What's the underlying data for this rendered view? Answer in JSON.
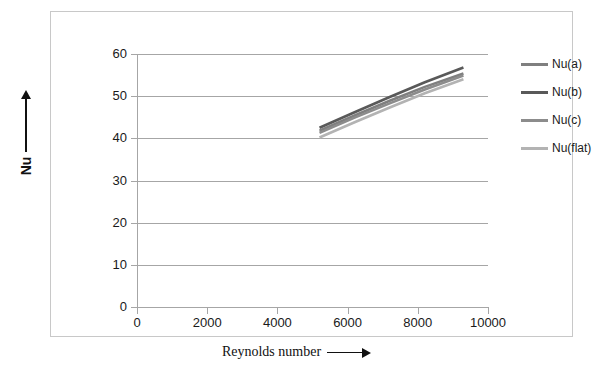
{
  "chart_data": {
    "type": "line",
    "title": "",
    "xlabel": "Reynolds number",
    "ylabel": "Nu",
    "xlim": [
      0,
      10000
    ],
    "ylim": [
      0,
      60
    ],
    "xticks": [
      0,
      2000,
      4000,
      6000,
      8000,
      10000
    ],
    "yticks": [
      0,
      10,
      20,
      30,
      40,
      50,
      60
    ],
    "xtick_labels": [
      "0",
      "2000",
      "4000",
      "6000",
      "8000",
      "10000"
    ],
    "ytick_labels": [
      "0",
      "10",
      "20",
      "30",
      "40",
      "50",
      "60"
    ],
    "grid": "horizontal",
    "legend_position": "right",
    "series": [
      {
        "name": "Nu(a)",
        "color": "#7f7f7f",
        "x": [
          5200,
          6200,
          7200,
          8200,
          9300
        ],
        "values": [
          41.8,
          45.4,
          48.9,
          52.2,
          55.4
        ]
      },
      {
        "name": "Nu(b)",
        "color": "#595959",
        "x": [
          5200,
          6200,
          7200,
          8200,
          9300
        ],
        "values": [
          42.5,
          46.2,
          49.8,
          53.3,
          56.8
        ]
      },
      {
        "name": "Nu(c)",
        "color": "#8c8c8c",
        "x": [
          5200,
          6200,
          7200,
          8200,
          9300
        ],
        "values": [
          41.3,
          44.9,
          48.3,
          51.6,
          54.9
        ]
      },
      {
        "name": "Nu(flat)",
        "color": "#b3b3b3",
        "x": [
          5200,
          6200,
          7200,
          8200,
          9300
        ],
        "values": [
          40.2,
          43.8,
          47.3,
          50.7,
          54.0
        ]
      }
    ]
  },
  "axes": {
    "x_title": "Reynolds number",
    "y_title": "Nu"
  },
  "colors": {
    "gridline": "#a6a6a6",
    "frame_border": "#c8c8c8",
    "text": "#1a1a1a"
  }
}
